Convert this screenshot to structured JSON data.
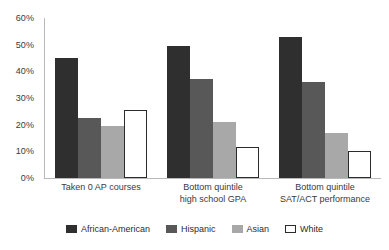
{
  "chart_data": {
    "type": "bar",
    "title": "",
    "subtitle": "",
    "xlabel": "",
    "ylabel": "",
    "ylim": [
      0,
      60
    ],
    "ytick_labels": [
      "60%",
      "50%",
      "40%",
      "30%",
      "20%",
      "10%",
      "0%"
    ],
    "ytick_values": [
      60,
      50,
      40,
      30,
      20,
      10,
      0
    ],
    "grid": false,
    "legend_position": "bottom",
    "value_suffix": "%",
    "categories": [
      "Taken 0 AP courses",
      "Bottom quintile high school GPA",
      "Bottom quintile SAT/ACT performance"
    ],
    "category_lines": [
      [
        "Taken 0 AP courses",
        ""
      ],
      [
        "Bottom quintile",
        "high school GPA"
      ],
      [
        "Bottom quintile",
        "SAT/ACT performance"
      ]
    ],
    "series": [
      {
        "name": "African-American",
        "color": "#2f2f2f",
        "values": [
          45,
          49.5,
          53
        ]
      },
      {
        "name": "Hispanic",
        "color": "#585858",
        "values": [
          22.5,
          37,
          36
        ]
      },
      {
        "name": "Asian",
        "color": "#a8a8a8",
        "values": [
          19.5,
          21,
          17
        ]
      },
      {
        "name": "White",
        "color": "#ffffff",
        "values": [
          25.5,
          11.5,
          10
        ]
      }
    ]
  },
  "legend": {
    "items": [
      {
        "label": "African-American",
        "swatch": "african-american-swatch"
      },
      {
        "label": "Hispanic",
        "swatch": "hispanic-swatch"
      },
      {
        "label": "Asian",
        "swatch": "asian-swatch"
      },
      {
        "label": "White",
        "swatch": "white-swatch"
      }
    ]
  }
}
